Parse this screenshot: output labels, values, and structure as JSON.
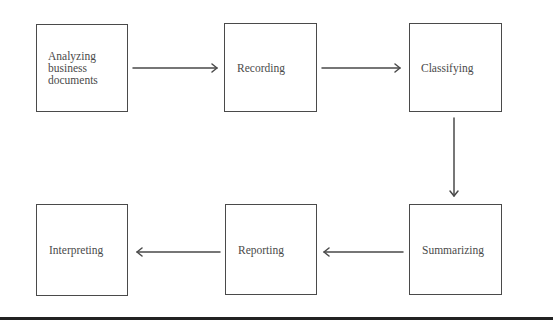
{
  "diagram": {
    "type": "process-flow",
    "nodes": [
      {
        "id": "analyzing",
        "label": "Analyzing\nbusiness\ndocuments"
      },
      {
        "id": "recording",
        "label": "Recording"
      },
      {
        "id": "classifying",
        "label": "Classifying"
      },
      {
        "id": "summarizing",
        "label": "Summarizing"
      },
      {
        "id": "reporting",
        "label": "Reporting"
      },
      {
        "id": "interpreting",
        "label": "Interpreting"
      }
    ],
    "edges": [
      {
        "from": "analyzing",
        "to": "recording"
      },
      {
        "from": "recording",
        "to": "classifying"
      },
      {
        "from": "classifying",
        "to": "summarizing"
      },
      {
        "from": "summarizing",
        "to": "reporting"
      },
      {
        "from": "reporting",
        "to": "interpreting"
      }
    ]
  },
  "colors": {
    "stroke": "#4a4a4a",
    "text": "#4a4a4a",
    "rule": "#222222",
    "background": "#ffffff"
  }
}
